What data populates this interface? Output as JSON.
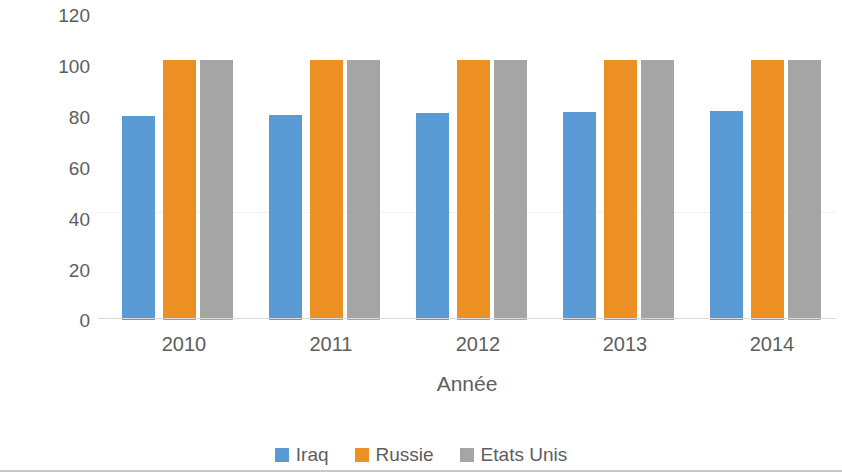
{
  "chart_data": {
    "type": "bar",
    "title": "",
    "xlabel": "Année",
    "ylabel": "Pourcentage de la population",
    "categories": [
      "2010",
      "2011",
      "2012",
      "2013",
      "2014"
    ],
    "series": [
      {
        "name": "Iraq",
        "color": "#5b9bd5",
        "values": [
          78.5,
          79.0,
          79.5,
          80.0,
          80.5
        ]
      },
      {
        "name": "Russie",
        "color": "#ed9024",
        "values": [
          100,
          100,
          100,
          100,
          100
        ]
      },
      {
        "name": "Etats Unis",
        "color": "#a5a5a5",
        "values": [
          100,
          100,
          100,
          100,
          100
        ]
      }
    ],
    "ylim": [
      0,
      120
    ],
    "yticks": [
      "0",
      "20",
      "40",
      "60",
      "80",
      "100",
      "120"
    ],
    "ytick_values": [
      0,
      20,
      40,
      60,
      80,
      100,
      120
    ],
    "grid": false,
    "legend_position": "bottom"
  },
  "legend": {
    "items": [
      {
        "label": "Iraq",
        "color": "#5b9bd5"
      },
      {
        "label": "Russie",
        "color": "#ed9024"
      },
      {
        "label": "Etats Unis",
        "color": "#a5a5a5"
      }
    ]
  }
}
